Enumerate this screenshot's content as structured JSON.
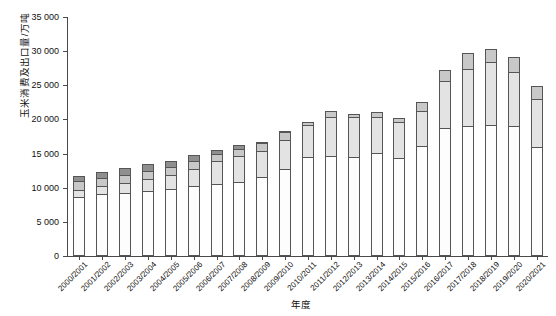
{
  "chart_data": {
    "type": "bar",
    "stacked": true,
    "title": "",
    "xlabel": "年度",
    "ylabel": "玉米消费及出口量/万吨",
    "ylim": [
      0,
      35000
    ],
    "ytick_step": 5000,
    "ytick_labels": [
      "0",
      "5 000",
      "10 000",
      "15 000",
      "20 000",
      "25 000",
      "30 000",
      "35 000"
    ],
    "ytick_values": [
      0,
      5000,
      10000,
      15000,
      20000,
      25000,
      30000,
      35000
    ],
    "grid": false,
    "legend": "none",
    "categories": [
      "2000/2001",
      "2001/2002",
      "2002/2003",
      "2003/2004",
      "2004/2005",
      "2005/2006",
      "2006/2007",
      "2007/2008",
      "2008/2009",
      "2009/2010",
      "2010/2011",
      "2011/2012",
      "2012/2013",
      "2013/2014",
      "2014/2015",
      "2015/2016",
      "2016/2017",
      "2017/2018",
      "2018/2019",
      "2019/2020",
      "2020/2021"
    ],
    "series": [
      {
        "name": "饲料消费",
        "key": "feed",
        "color": "#fdfdfd",
        "values": [
          8700,
          9100,
          9200,
          9500,
          9800,
          10200,
          10600,
          10900,
          11500,
          12800,
          14500,
          14600,
          14500,
          15100,
          14300,
          16100,
          18800,
          19000,
          19200,
          19000,
          15900
        ]
      },
      {
        "name": "工业消费",
        "key": "industrial",
        "color": "#e3e3e3",
        "values": [
          1000,
          1200,
          1500,
          1800,
          2100,
          2500,
          3300,
          3700,
          3900,
          4200,
          4700,
          5800,
          5800,
          5300,
          5300,
          5100,
          6900,
          8400,
          9200,
          8000,
          7100
        ]
      },
      {
        "name": "食用及种用消费",
        "key": "food",
        "color": "#c8c8c8",
        "values": [
          1300,
          1100,
          1200,
          1100,
          1100,
          1200,
          1100,
          1100,
          1100,
          1100,
          400,
          800,
          500,
          700,
          600,
          1300,
          1500,
          2300,
          1900,
          2100,
          1900
        ]
      },
      {
        "name": "出口量",
        "key": "export",
        "color": "#8f8f8f",
        "values": [
          700,
          900,
          1000,
          1100,
          900,
          900,
          500,
          500,
          200,
          100,
          0,
          0,
          0,
          0,
          0,
          0,
          0,
          0,
          0,
          0,
          0
        ]
      }
    ],
    "totals": [
      11700,
      12300,
      12900,
      13500,
      13900,
      14800,
      15500,
      16200,
      16700,
      18200,
      19600,
      21200,
      20800,
      21100,
      20200,
      22500,
      27200,
      29700,
      30300,
      29100,
      24900
    ]
  }
}
